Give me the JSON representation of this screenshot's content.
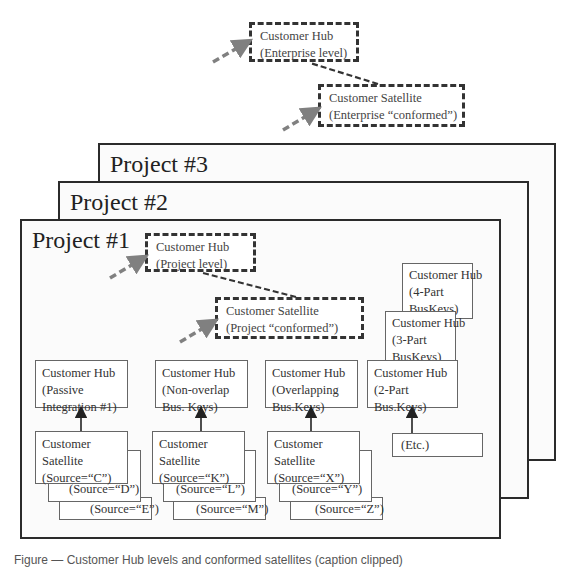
{
  "enterprise": {
    "hub": {
      "line1": "Customer Hub",
      "line2": "(Enterprise level)"
    },
    "satellite": {
      "line1": "Customer Satellite",
      "line2": "(Enterprise “conformed”)"
    }
  },
  "projects": [
    {
      "title": "Project #3"
    },
    {
      "title": "Project #2"
    },
    {
      "title": "Project #1"
    }
  ],
  "project1": {
    "hub": {
      "line1": "Customer Hub",
      "line2": "(Project level)"
    },
    "satellite": {
      "line1": "Customer Satellite",
      "line2": "(Project “conformed”)"
    },
    "stacked_hubs": [
      {
        "line1": "Customer Hub",
        "line2": "(4-Part",
        "line3": "BusKeys)"
      },
      {
        "line1": "Customer Hub",
        "line2": "(3-Part",
        "line3": "BusKeys)"
      }
    ],
    "hub_row": [
      {
        "line1": "Customer Hub",
        "line2": "(Passive",
        "line3": "Integration #1)"
      },
      {
        "line1": "Customer Hub",
        "line2": "(Non-overlap",
        "line3": "Bus. Keys)"
      },
      {
        "line1": "Customer Hub",
        "line2": "(Overlapping",
        "line3": "Bus.Keys)"
      },
      {
        "line1": "Customer Hub",
        "line2": "(2-Part",
        "line3": "Bus.Keys)"
      }
    ],
    "satellite_groups": [
      {
        "line1": "Customer",
        "line2": "Satellite",
        "sources": [
          "(Source=“C”)",
          "(Source=“D”)",
          "(Source=“E”)"
        ]
      },
      {
        "line1": "Customer",
        "line2": "Satellite",
        "sources": [
          "(Source=“K”)",
          "(Source=“L”)",
          "(Source=“M”)"
        ]
      },
      {
        "line1": "Customer",
        "line2": "Satellite",
        "sources": [
          "(Source=“X”)",
          "(Source=“Y”)",
          "(Source=“Z”)"
        ]
      }
    ],
    "etc": "(Etc.)"
  },
  "caption": "Figure — Customer Hub levels and conformed satellites (caption clipped)",
  "colors": {
    "frame_border": "#2b2b2b",
    "dashed_border": "#333333",
    "gray_arrow": "#808080",
    "frame_fill": "#fbfbfb"
  }
}
